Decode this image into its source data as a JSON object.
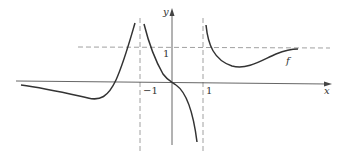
{
  "figure": {
    "type": "function-graph",
    "function_label": "f",
    "axes": {
      "x_label": "x",
      "y_label": "y",
      "tick_labels": {
        "x_neg_one": "−1",
        "x_one": "1",
        "y_one": "1"
      }
    },
    "asymptotes": {
      "vertical": [
        "x = -1",
        "x = 1"
      ],
      "horizontal": [
        "y = 1"
      ]
    },
    "colors": {
      "curve": "#333333",
      "axis": "#555555",
      "asymptote": "#888888",
      "background": "#ffffff"
    }
  }
}
